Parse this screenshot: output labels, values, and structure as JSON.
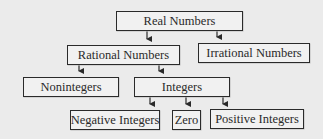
{
  "diagram": {
    "colors": {
      "background": "#ebebeb",
      "box_fill": "#f1f1f1",
      "stroke": "#2a2a2a"
    },
    "nodes": {
      "real": {
        "label": "Real Numbers"
      },
      "rational": {
        "label": "Rational Numbers"
      },
      "irrational": {
        "label": "Irrational Numbers"
      },
      "nonintegers": {
        "label": "Nonintegers"
      },
      "integers": {
        "label": "Integers"
      },
      "negative": {
        "label": "Negative Integers"
      },
      "zero": {
        "label": "Zero"
      },
      "positive": {
        "label": "Positive Integers"
      }
    },
    "edges": [
      {
        "from": "Real Numbers",
        "to": "Rational Numbers"
      },
      {
        "from": "Real Numbers",
        "to": "Irrational Numbers"
      },
      {
        "from": "Rational Numbers",
        "to": "Nonintegers"
      },
      {
        "from": "Rational Numbers",
        "to": "Integers"
      },
      {
        "from": "Integers",
        "to": "Negative Integers"
      },
      {
        "from": "Integers",
        "to": "Zero"
      },
      {
        "from": "Integers",
        "to": "Positive Integers"
      }
    ]
  }
}
